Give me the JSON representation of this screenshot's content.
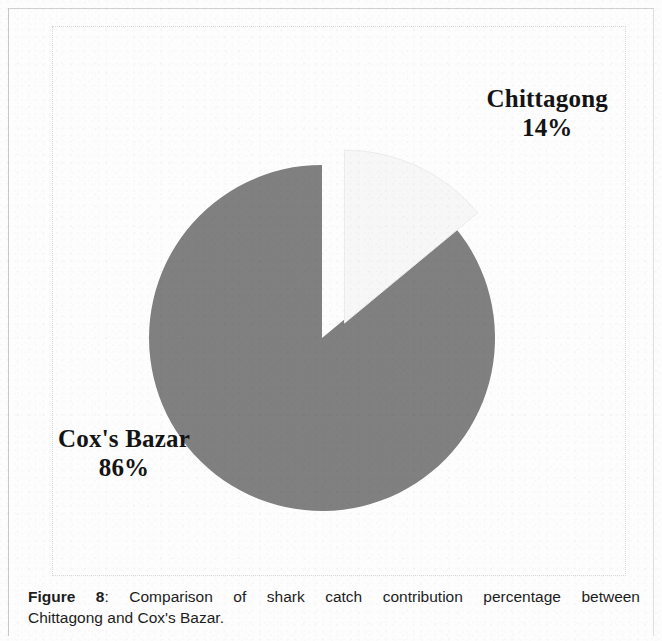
{
  "figure": {
    "caption_label": "Figure 8",
    "caption_separator": ":",
    "caption_line_1": "Comparison of shark catch contribution percentage between",
    "caption_line_2": "Chittagong and Cox's Bazar.",
    "caption_full": "Figure 8: Comparison of shark catch contribution percentage between Chittagong and Cox's Bazar."
  },
  "labels": {
    "chittagong_name": "Chittagong",
    "chittagong_pct": "14%",
    "coxsbazar_name": "Cox's Bazar",
    "coxsbazar_pct": "86%"
  },
  "colors": {
    "coxsbazar_fill": "#808080",
    "chittagong_fill": "#f7f7f7",
    "chittagong_stroke": "#ededed",
    "text": "#141414",
    "frame": "#d8d8d8",
    "page": "#fdfdfd"
  },
  "chart_data": {
    "type": "pie",
    "title": "",
    "subtitle": "",
    "xlabel": "",
    "ylabel": "",
    "categories": [
      "Cox's Bazar",
      "Chittagong"
    ],
    "values": [
      86,
      14
    ],
    "units": "percent",
    "data_labels": [
      "Cox's Bazar 86%",
      "Chittagong 14%"
    ],
    "colors": [
      "#808080",
      "#f7f7f7"
    ],
    "exploded": [
      "Chittagong"
    ],
    "explode_offset_px": 22,
    "start_angle_deg": 0,
    "direction": "clockwise",
    "legend": false,
    "legend_position": "none",
    "grid": false,
    "annotations": [
      {
        "text": "Chittagong",
        "position": "top-right",
        "for": "Chittagong"
      },
      {
        "text": "14%",
        "position": "top-right",
        "for": "Chittagong"
      },
      {
        "text": "Cox's Bazar",
        "position": "left",
        "for": "Cox's Bazar"
      },
      {
        "text": "86%",
        "position": "left",
        "for": "Cox's Bazar"
      }
    ]
  }
}
